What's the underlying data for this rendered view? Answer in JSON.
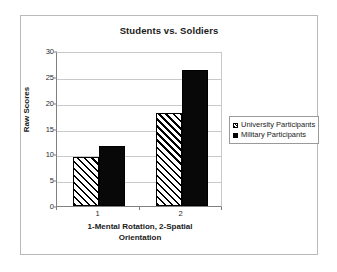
{
  "chart_data": {
    "type": "bar",
    "title": "Students vs. Soldiers",
    "xlabel": "1-Mental Rotation, 2-Spatial Orientation",
    "ylabel": "Raw Scores",
    "categories": [
      "1",
      "2"
    ],
    "ylim": [
      0,
      30
    ],
    "yticks": [
      0,
      5,
      10,
      15,
      20,
      25,
      30
    ],
    "ytick_labels": [
      "0",
      "5",
      "10",
      "15",
      "20",
      "25",
      "30"
    ],
    "grid": true,
    "legend_position": "right",
    "series": [
      {
        "name": "University Participants",
        "fill": "hatched",
        "values": [
          9.5,
          18.0
        ]
      },
      {
        "name": "Military Participants",
        "fill": "solid",
        "values": [
          11.7,
          26.3
        ]
      }
    ]
  },
  "legend": {
    "items": [
      {
        "label": "University Participants",
        "swatch": "hatched-swatch-icon"
      },
      {
        "label": "Military Participants",
        "swatch": "solid-swatch-icon"
      }
    ]
  },
  "axis": {
    "x_title_line1": "1-Mental Rotation, 2-Spatial",
    "x_title_line2": "Orientation"
  },
  "colors": {
    "series_solid": "#000000",
    "series_hatch": "#000000",
    "background": "#ffffff",
    "gridline": "#c9c9c9",
    "axis": "#808080",
    "frame": "#b9b9b9",
    "text": "#1a1a1a"
  }
}
